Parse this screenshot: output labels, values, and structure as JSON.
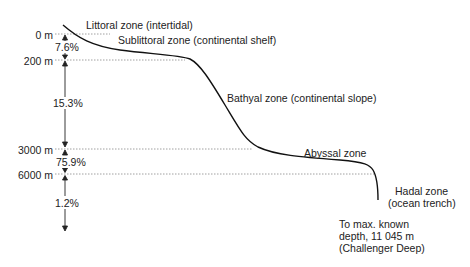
{
  "zones": {
    "littoral": "Littoral zone (intertidal)",
    "sublittoral": "Sublittoral zone (continental shelf)",
    "bathyal": "Bathyal zone (continental slope)",
    "abyssal": "Abyssal zone",
    "hadal_line1": "Hadal zone",
    "hadal_line2": "(ocean trench)"
  },
  "depths": {
    "d0": "0 m",
    "d200": "200 m",
    "d3000": "3000 m",
    "d6000": "6000 m"
  },
  "percentages": {
    "p1": "7.6%",
    "p2": "15.3%",
    "p3": "75.9%",
    "p4": "1.2%"
  },
  "note": {
    "line1": "To max. known",
    "line2": "depth, 11 045 m",
    "line3": "(Challenger Deep)"
  },
  "colors": {
    "line": "#111111",
    "dashed": "#888888"
  }
}
